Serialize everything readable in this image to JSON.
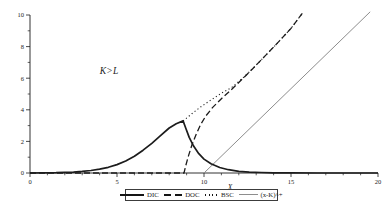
{
  "figure": {
    "background": "#ffffff",
    "ink_color": "#1c1c1c",
    "payoff_line_color": "#8d8d8d"
  },
  "chart_data": {
    "type": "line",
    "title": "",
    "xlabel": "X",
    "ylabel": "",
    "xlim": [
      0,
      20
    ],
    "ylim": [
      0,
      10
    ],
    "grid": false,
    "legend_position": "bottom-center",
    "x_major_ticks": [
      0,
      5,
      10,
      15,
      20
    ],
    "x_minor_ticks": [
      1,
      2,
      3,
      4,
      6,
      7,
      8,
      9,
      11,
      12,
      13,
      14,
      16,
      17,
      18,
      19
    ],
    "y_major_ticks": [
      0,
      2,
      4,
      6,
      8,
      10
    ],
    "y_minor_ticks": [
      1,
      3,
      5,
      7,
      9
    ],
    "annotations": [
      {
        "text": "K>L",
        "x": 4.55,
        "y": 6.25
      }
    ],
    "series": [
      {
        "id": "bsc",
        "name": "BSC",
        "style": "dotted",
        "points": [
          [
            8.8,
            3.3
          ],
          [
            9.3,
            3.75
          ],
          [
            9.8,
            4.18
          ],
          [
            10.4,
            4.62
          ],
          [
            11,
            5.05
          ],
          [
            11.6,
            5.42
          ],
          [
            12.2,
            5.98
          ],
          [
            12.8,
            6.6
          ],
          [
            13.5,
            7.4
          ],
          [
            14.2,
            8.2
          ],
          [
            15,
            9.15
          ],
          [
            15.65,
            10.1
          ]
        ]
      },
      {
        "id": "payoff",
        "name": "(x-K)^+",
        "style": "solid-thin",
        "points": [
          [
            10,
            0
          ],
          [
            19.55,
            10.2
          ]
        ]
      },
      {
        "id": "doc",
        "name": "DOC",
        "style": "dashed",
        "points": [
          [
            0,
            0
          ],
          [
            5,
            0
          ],
          [
            8.85,
            0
          ],
          [
            8.95,
            0.45
          ],
          [
            9.1,
            1.05
          ],
          [
            9.3,
            1.75
          ],
          [
            9.55,
            2.45
          ],
          [
            9.8,
            3.05
          ],
          [
            10.1,
            3.6
          ],
          [
            10.5,
            4.15
          ],
          [
            11,
            4.7
          ],
          [
            11.6,
            5.3
          ],
          [
            12.2,
            5.95
          ],
          [
            12.8,
            6.6
          ],
          [
            13.5,
            7.4
          ],
          [
            14.2,
            8.2
          ],
          [
            15,
            9.15
          ],
          [
            15.65,
            10.1
          ]
        ]
      },
      {
        "id": "dic",
        "name": "DIC",
        "style": "solid-thick",
        "points": [
          [
            0,
            0
          ],
          [
            1.5,
            0.02
          ],
          [
            2.5,
            0.06
          ],
          [
            3,
            0.1
          ],
          [
            3.5,
            0.16
          ],
          [
            4,
            0.24
          ],
          [
            4.5,
            0.36
          ],
          [
            5,
            0.53
          ],
          [
            5.5,
            0.76
          ],
          [
            6,
            1.06
          ],
          [
            6.5,
            1.44
          ],
          [
            7,
            1.88
          ],
          [
            7.5,
            2.36
          ],
          [
            8,
            2.85
          ],
          [
            8.4,
            3.12
          ],
          [
            8.8,
            3.3
          ],
          [
            8.95,
            2.85
          ],
          [
            9.15,
            2.25
          ],
          [
            9.4,
            1.7
          ],
          [
            9.7,
            1.22
          ],
          [
            10,
            0.88
          ],
          [
            10.4,
            0.58
          ],
          [
            10.9,
            0.35
          ],
          [
            11.4,
            0.21
          ],
          [
            12,
            0.11
          ],
          [
            12.6,
            0.06
          ],
          [
            13.3,
            0.03
          ],
          [
            14,
            0.015
          ],
          [
            15,
            0.008
          ],
          [
            16.5,
            0
          ],
          [
            20,
            0
          ]
        ]
      }
    ]
  },
  "legend": {
    "items": [
      {
        "label": "DIC",
        "style": "solid-thick"
      },
      {
        "label": "DOC",
        "style": "dashed"
      },
      {
        "label": "BSC",
        "style": "dotted"
      },
      {
        "label": "(x-K)^+",
        "style": "solid-thin"
      }
    ]
  }
}
